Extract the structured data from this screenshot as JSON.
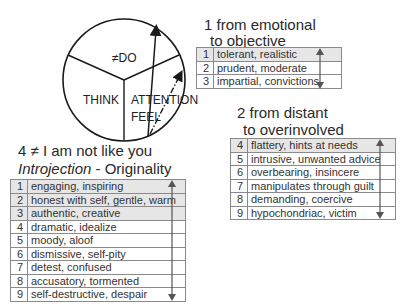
{
  "circle": {
    "labels": {
      "do": "≠DO",
      "think": "THINK",
      "attention": "ATTENTION",
      "feel": "FEEL"
    }
  },
  "group1": {
    "title_line1": "1 from emotional",
    "title_line2": "to objective",
    "rows": [
      {
        "num": "1",
        "text": "tolerant, realistic",
        "shaded": true
      },
      {
        "num": "2",
        "text": "prudent, moderate",
        "shaded": false
      },
      {
        "num": "3",
        "text": "impartial, convictions",
        "shaded": false
      }
    ]
  },
  "group2": {
    "title_line1": "2 from distant",
    "title_line2": "to overinvolved",
    "rows": [
      {
        "num": "4",
        "text": "flattery, hints at needs",
        "shaded": true
      },
      {
        "num": "5",
        "text": "intrusive, unwanted advice",
        "shaded": false
      },
      {
        "num": "6",
        "text": "overbearing, insincere",
        "shaded": false
      },
      {
        "num": "7",
        "text": "manipulates through guilt",
        "shaded": false
      },
      {
        "num": "8",
        "text": "demanding, coercive",
        "shaded": false
      },
      {
        "num": "9",
        "text": "hypochondriac, victim",
        "shaded": false
      }
    ]
  },
  "group4": {
    "title_line1": "4 ≠ I am not like you",
    "title_italic": "Introjection",
    "title_rest": " - Originality",
    "rows": [
      {
        "num": "1",
        "text": "engaging, inspiring",
        "shaded": true
      },
      {
        "num": "2",
        "text": "honest with self, gentle, warm",
        "shaded": true
      },
      {
        "num": "3",
        "text": "authentic, creative",
        "shaded": true
      },
      {
        "num": "4",
        "text": "dramatic, idealize",
        "shaded": false
      },
      {
        "num": "5",
        "text": "moody, aloof",
        "shaded": false
      },
      {
        "num": "6",
        "text": "dismissive, self-pity",
        "shaded": false
      },
      {
        "num": "7",
        "text": "detest, confused",
        "shaded": false
      },
      {
        "num": "8",
        "text": "accusatory, tormented",
        "shaded": false
      },
      {
        "num": "9",
        "text": "self-destructive, despair",
        "shaded": false
      }
    ]
  },
  "colors": {
    "line": "#1a1a1a",
    "border": "#8a8a8a",
    "shade": "#e6e6e6",
    "arrow": "#555555"
  }
}
